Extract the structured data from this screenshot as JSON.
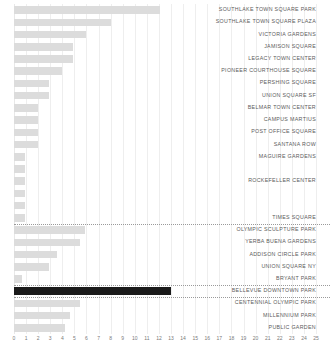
{
  "chart_data": {
    "type": "bar",
    "orientation": "horizontal",
    "title": "",
    "xlabel": "",
    "ylabel": "",
    "xlim": [
      0,
      25
    ],
    "grid": true,
    "legend": null,
    "axis_ticks": [
      "0",
      "1",
      "2",
      "3",
      "4",
      "5",
      "6",
      "7",
      "8",
      "9",
      "10",
      "11",
      "12",
      "13",
      "14",
      "15",
      "16",
      "17",
      "18",
      "19",
      "20",
      "21",
      "22",
      "23",
      "24",
      "25"
    ],
    "colors": {
      "bar": "#dcdcdc",
      "highlight_bar": "#1a1a1a",
      "gridline": "#eeeeee",
      "label_text": "#5b5b5b",
      "tick_text": "#7a7a7a",
      "separator": "#9a9a9a",
      "background": "#ffffff"
    },
    "highlighted_category": "BELLEVUE DOWNTOWN PARK",
    "categories": [
      "SOUTHLAKE TOWN SQUARE PARK",
      "SOUTHLAKE TOWN SQUARE PLAZA",
      "VICTORIA GARDENS",
      "JAMISON SQUARE",
      "LEGACY TOWN CENTER",
      "PIONEER COURTHOUSE SQUARE",
      "PERSHING SQUARE",
      "UNION SQUARE SF",
      "BELMAR TOWN CENTER",
      "CAMPUS MARTIUS",
      "POST OFFICE SQUARE",
      "SANTANA ROW",
      "MAGUIRE GARDENS",
      "",
      "ROCKEFELLER CENTER",
      "",
      "",
      "TIMES SQUARE",
      "OLYMPIC SCULPTURE PARK",
      "YERBA BUENA GARDENS",
      "ADDISON CIRCLE PARK",
      "UNION SQUARE NY",
      "BRYANT PARK",
      "BELLEVUE DOWNTOWN PARK",
      "CENTENNIAL OLYMPIC PARK",
      "MILLENNIUM PARK",
      "PUBLIC GARDEN"
    ],
    "values": [
      12.1,
      8.0,
      6.0,
      4.9,
      4.9,
      4.0,
      2.9,
      2.9,
      2.0,
      2.0,
      2.0,
      2.0,
      0.9,
      0.9,
      0.9,
      0.9,
      0.9,
      0.9,
      5.9,
      5.5,
      3.6,
      2.9,
      0.7,
      13.0,
      5.5,
      4.6,
      4.2
    ],
    "separators_after_index": [
      17,
      22,
      23
    ]
  }
}
